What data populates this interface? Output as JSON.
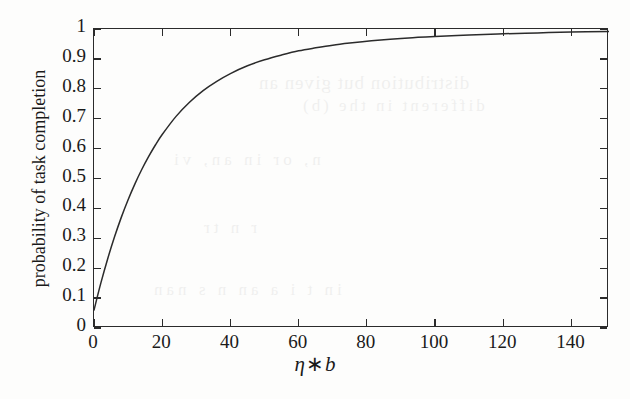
{
  "chart_data": {
    "type": "line",
    "title": "",
    "xlabel": "η * b",
    "xlabel_parts": {
      "var1": "η",
      "op": "∗",
      "var2": "b"
    },
    "ylabel": "probability of task completion",
    "xlim": [
      0,
      151
    ],
    "ylim": [
      0,
      1
    ],
    "grid": false,
    "legend": null,
    "xticks": [
      0,
      20,
      40,
      60,
      80,
      100,
      120,
      140
    ],
    "xtick_labels": [
      "0",
      "20",
      "40",
      "60",
      "80",
      "100",
      "120",
      "140"
    ],
    "yticks": [
      0,
      0.1,
      0.2,
      0.3,
      0.4,
      0.5,
      0.6,
      0.7,
      0.8,
      0.9,
      1
    ],
    "ytick_labels": [
      "0",
      "0.1",
      "0.2",
      "0.3",
      "0.4",
      "0.5",
      "0.6",
      "0.7",
      "0.8",
      "0.9",
      "1"
    ],
    "series": [
      {
        "name": "probability of task completion",
        "color": "#2b2b2b",
        "x": [
          0,
          2,
          4,
          6,
          8,
          10,
          12,
          14,
          16,
          18,
          20,
          24,
          28,
          32,
          36,
          40,
          45,
          50,
          55,
          60,
          65,
          70,
          75,
          80,
          85,
          90,
          95,
          100,
          110,
          120,
          130,
          140,
          151
        ],
        "y": [
          0.06,
          0.15,
          0.231,
          0.304,
          0.37,
          0.429,
          0.482,
          0.53,
          0.573,
          0.612,
          0.647,
          0.707,
          0.755,
          0.794,
          0.825,
          0.851,
          0.877,
          0.897,
          0.913,
          0.927,
          0.937,
          0.946,
          0.953,
          0.959,
          0.964,
          0.968,
          0.972,
          0.975,
          0.98,
          0.984,
          0.987,
          0.99,
          0.992
        ]
      }
    ]
  },
  "axes": {
    "tick_side": "inward",
    "frame": "box",
    "frame_color": "#2b2b2b"
  },
  "artifact": {
    "note": "scan bleed-through",
    "lines": [
      "distribution but given an",
      "different in the   (b)",
      "n, or in   an, vi",
      "r   n          tr",
      "in t i  a an  n s nan"
    ]
  }
}
